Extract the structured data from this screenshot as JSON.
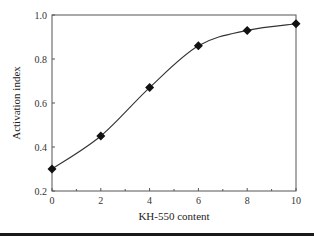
{
  "chart_data": {
    "type": "line",
    "title": "",
    "xlabel": "KH-550 content",
    "ylabel": "Activation index",
    "x": [
      0,
      2,
      4,
      6,
      8,
      10
    ],
    "series": [
      {
        "name": "Activation index",
        "values": [
          0.3,
          0.45,
          0.67,
          0.86,
          0.93,
          0.96
        ],
        "marker": "diamond",
        "color": "#111111"
      }
    ],
    "xlim": [
      0,
      10
    ],
    "ylim": [
      0.2,
      1.0
    ],
    "xticks": [
      "0",
      "2",
      "4",
      "6",
      "8",
      "10"
    ],
    "yticks": [
      "0.2",
      "0.4",
      "0.6",
      "0.8",
      "1.0"
    ],
    "grid": false,
    "legend": "none",
    "smooth": true
  }
}
